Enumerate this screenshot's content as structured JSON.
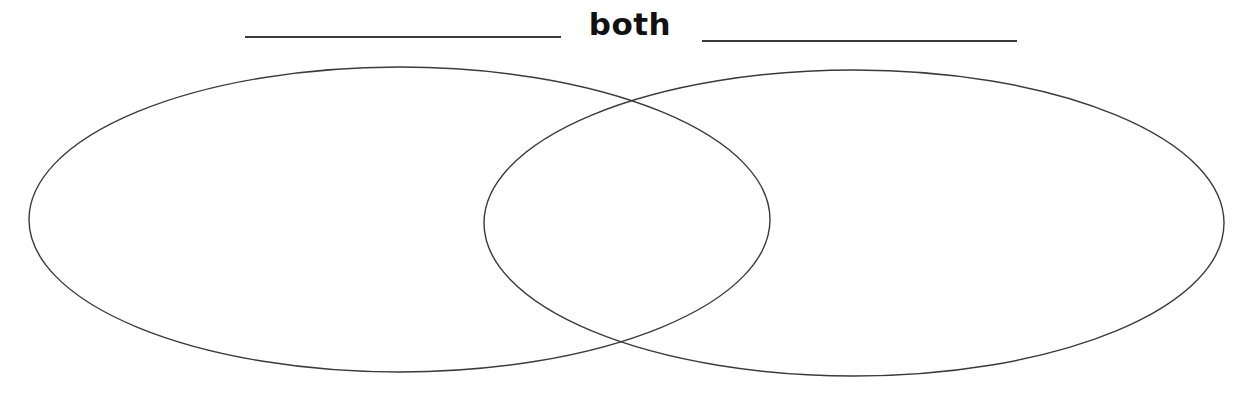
{
  "diagram": {
    "type": "venn",
    "title": "both",
    "left_label_blank": "",
    "right_label_blank": "",
    "circles": [
      {
        "id": "left",
        "cx": 399.5,
        "cy": 219.5,
        "rx": 370.5,
        "ry": 152.5
      },
      {
        "id": "right",
        "cx": 854,
        "cy": 223,
        "rx": 370,
        "ry": 153
      }
    ],
    "stroke_color": "#3a3a3a",
    "background": "#ffffff"
  }
}
